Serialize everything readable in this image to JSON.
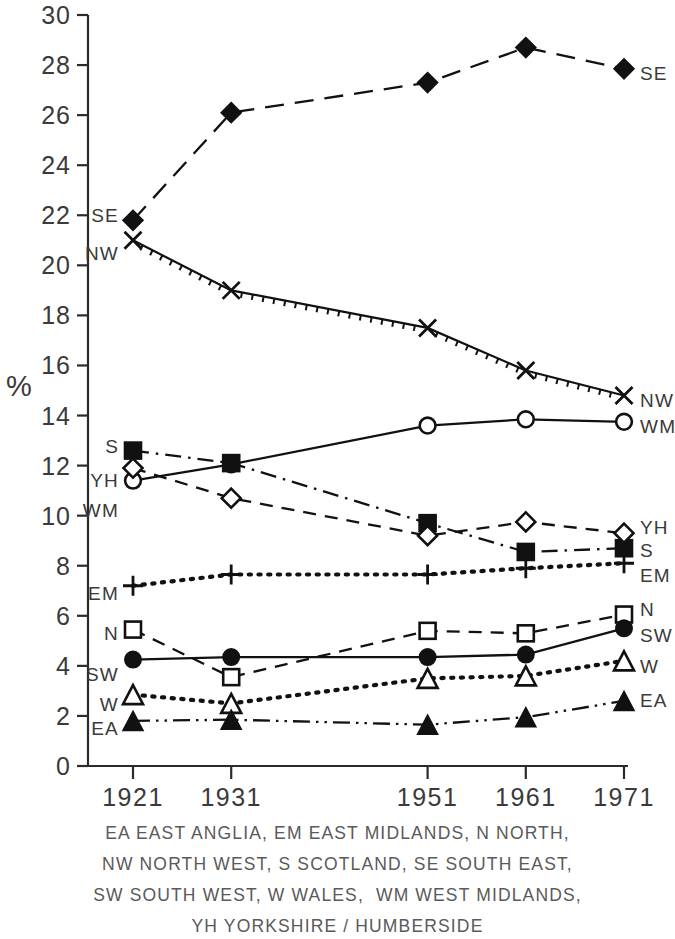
{
  "chart_data": {
    "type": "line",
    "title": "",
    "xlabel": "",
    "ylabel": "%",
    "x": [
      1921,
      1931,
      1951,
      1961,
      1971
    ],
    "xtick_labels": [
      "1921",
      "1931",
      "1951",
      "1961",
      "1971"
    ],
    "ytick_labels": [
      "0",
      "2",
      "4",
      "6",
      "8",
      "10",
      "12",
      "14",
      "16",
      "18",
      "20",
      "22",
      "24",
      "26",
      "28",
      "30"
    ],
    "ytick_values": [
      0,
      2,
      4,
      6,
      8,
      10,
      12,
      14,
      16,
      18,
      20,
      22,
      24,
      26,
      28,
      30
    ],
    "ylim": [
      0,
      30
    ],
    "grid": false,
    "legend_position": "inline-endpoints",
    "series": [
      {
        "name": "SE",
        "label_left": "SE",
        "label_right": "SE",
        "marker": "filled-diamond",
        "linestyle": "long-dash",
        "values": [
          21.8,
          26.1,
          27.3,
          28.7,
          27.85
        ]
      },
      {
        "name": "NW",
        "label_left": "NW",
        "label_right": "NW",
        "marker": "cross-x",
        "linestyle": "hatched",
        "values": [
          21.0,
          19.0,
          17.5,
          15.8,
          14.8
        ]
      },
      {
        "name": "WM",
        "label_left": "WM",
        "label_right": "WM",
        "marker": "open-circle",
        "linestyle": "solid",
        "values": [
          11.4,
          12.05,
          13.6,
          13.85,
          13.75
        ]
      },
      {
        "name": "S",
        "label_left": "S",
        "label_right": "S",
        "marker": "filled-square",
        "linestyle": "dash-dot",
        "values": [
          12.6,
          12.1,
          9.7,
          8.55,
          8.7
        ]
      },
      {
        "name": "YH",
        "label_left": "YH",
        "label_right": "YH",
        "marker": "open-diamond",
        "linestyle": "dashed",
        "values": [
          11.9,
          10.7,
          9.2,
          9.75,
          9.3
        ]
      },
      {
        "name": "EM",
        "label_left": "EM",
        "label_right": "EM",
        "marker": "plus",
        "linestyle": "dotted",
        "values": [
          7.2,
          7.65,
          7.65,
          7.9,
          8.1
        ]
      },
      {
        "name": "N",
        "label_left": "N",
        "label_right": "N",
        "marker": "open-square",
        "linestyle": "dashed",
        "values": [
          5.45,
          3.55,
          5.4,
          5.3,
          6.05
        ]
      },
      {
        "name": "SW",
        "label_left": "SW",
        "label_right": "SW",
        "marker": "filled-circle",
        "linestyle": "solid",
        "values": [
          4.25,
          4.35,
          4.35,
          4.45,
          5.5
        ]
      },
      {
        "name": "W",
        "label_left": "W",
        "label_right": "W",
        "marker": "open-triangle",
        "linestyle": "dotted",
        "values": [
          2.85,
          2.5,
          3.5,
          3.6,
          4.2
        ]
      },
      {
        "name": "EA",
        "label_left": "EA",
        "label_right": "EA",
        "marker": "filled-triangle",
        "linestyle": "dash-dot-dot",
        "values": [
          1.8,
          1.85,
          1.65,
          1.95,
          2.6
        ]
      }
    ]
  },
  "caption": {
    "lines": [
      "EA EAST ANGLIA, EM EAST MIDLANDS, N NORTH,",
      "NW NORTH WEST, S SCOTLAND, SE SOUTH EAST,",
      "SW SOUTH WEST, W WALES,  WM WEST MIDLANDS,",
      "YH YORKSHIRE / HUMBERSIDE"
    ]
  },
  "colors": {
    "ink": "#111111",
    "axis": "#2b2b2b",
    "text": "#3a3a3a",
    "caption": "#5a5a5a",
    "background": "#ffffff"
  }
}
